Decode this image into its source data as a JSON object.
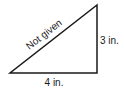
{
  "diagram": {
    "type": "right-triangle",
    "labels": {
      "hypotenuse": "Not given",
      "vertical_side": "3 in.",
      "base": "4 in."
    },
    "colors": {
      "stroke": "#1a1a1a",
      "background": "#ffffff"
    }
  }
}
